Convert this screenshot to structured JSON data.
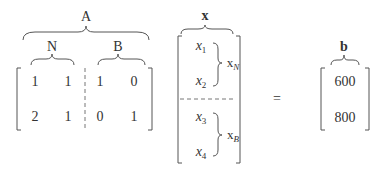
{
  "equation": {
    "A": {
      "label": "A",
      "N": {
        "label": "N",
        "rows": [
          [
            "1",
            "1"
          ],
          [
            "2",
            "1"
          ]
        ]
      },
      "B": {
        "label": "B",
        "rows": [
          [
            "1",
            "0"
          ],
          [
            "0",
            "1"
          ]
        ]
      }
    },
    "x": {
      "label": "x",
      "entries": [
        {
          "base": "x",
          "sub": "1"
        },
        {
          "base": "x",
          "sub": "2"
        },
        {
          "base": "x",
          "sub": "3"
        },
        {
          "base": "x",
          "sub": "4"
        }
      ],
      "groups": [
        {
          "base": "x",
          "sub": "N"
        },
        {
          "base": "x",
          "sub": "B"
        }
      ]
    },
    "equals": "=",
    "b": {
      "label": "b",
      "values": [
        "600",
        "800"
      ]
    }
  }
}
